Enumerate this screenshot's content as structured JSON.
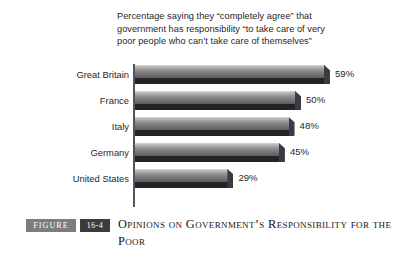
{
  "header": {
    "lines": [
      "Percentage saying they “completely agree” that",
      "government has responsibility “to take care of very",
      "poor people who can’t take care of themselves”"
    ]
  },
  "caption": {
    "figure_label": "FIGURE",
    "figure_number": "16-4",
    "title": "Opinions on Government’s Responsibility for the Poor"
  },
  "colors": {
    "bar_light": "#d8d8d8",
    "bar_mid": "#8f8f8f",
    "bar_dark": "#5e5e5e",
    "bar_shadow": "#23232a",
    "axis": "#555555",
    "badge_figure_bg": "#7d7d7d",
    "badge_number_bg": "#3b3b3b",
    "background": "#ffffff"
  },
  "chart_data": {
    "type": "bar",
    "orientation": "horizontal",
    "title": "Percentage saying they “completely agree” that government has responsibility “to take care of very poor people who can’t take care of themselves”",
    "xlabel": "",
    "ylabel": "",
    "xlim": [
      0,
      62
    ],
    "grid": false,
    "legend": false,
    "categories": [
      "Great Britain",
      "France",
      "Italy",
      "Germany",
      "United States"
    ],
    "values": [
      59,
      50,
      48,
      45,
      29
    ],
    "value_labels": [
      "59%",
      "50%",
      "48%",
      "45%",
      "29%"
    ],
    "value_suffix": "%"
  }
}
